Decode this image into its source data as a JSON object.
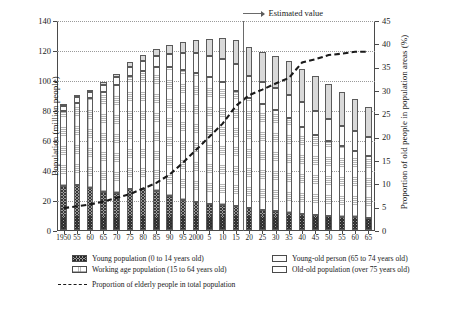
{
  "chart_data": {
    "type": "bar",
    "title": "",
    "subtitle": "",
    "xlabel": "",
    "ylabel": "Population (million people)",
    "y2label": "Proportion of old people in  population areas (%)",
    "ylim": [
      0,
      140
    ],
    "y2lim": [
      0,
      45
    ],
    "yticks": [
      0,
      20,
      40,
      60,
      80,
      100,
      120,
      140
    ],
    "y2ticks": [
      0,
      5,
      10,
      15,
      20,
      25,
      30,
      35,
      40,
      45
    ],
    "grid": true,
    "legend_position": "below-plot",
    "stacked": true,
    "categories": [
      "1950",
      "55",
      "60",
      "65",
      "70",
      "75",
      "80",
      "85",
      "90",
      "95",
      "2000",
      "5",
      "10",
      "15",
      "20",
      "25",
      "30",
      "35",
      "40",
      "45",
      "50",
      "55",
      "60",
      "65"
    ],
    "series": [
      {
        "name": "Young population (0 to 14 years old)",
        "key": "young",
        "pattern": "crosshatch-dark",
        "values": [
          29.4,
          30.0,
          28.1,
          25.2,
          24.8,
          27.2,
          27.5,
          26.0,
          22.5,
          20.0,
          18.5,
          17.6,
          16.8,
          15.9,
          14.6,
          13.2,
          12.4,
          11.6,
          10.7,
          10.0,
          9.4,
          8.9,
          8.5,
          8.0
        ]
      },
      {
        "name": "Working age population (15 to 64 years old)",
        "key": "working",
        "pattern": "fine-dot",
        "values": [
          50.0,
          55.0,
          60.0,
          67.0,
          72.0,
          75.8,
          78.8,
          82.5,
          86.0,
          87.0,
          86.2,
          84.1,
          81.7,
          77.0,
          73.4,
          70.8,
          67.7,
          63.4,
          57.9,
          53.5,
          50.1,
          47.2,
          44.2,
          41.1
        ]
      },
      {
        "name": "Young-old person (65 to 74 years old)",
        "key": "young_old",
        "pattern": "solid-light",
        "values": [
          3.1,
          3.4,
          3.8,
          4.3,
          5.1,
          5.9,
          6.6,
          7.4,
          8.9,
          11.1,
          13.0,
          14.1,
          15.2,
          17.5,
          14.9,
          14.6,
          14.3,
          15.0,
          16.8,
          15.9,
          14.3,
          13.4,
          13.1,
          12.7
        ]
      },
      {
        "name": "Old-old population (over 75 years old)",
        "key": "old_old",
        "pattern": "solid-grey",
        "values": [
          1.1,
          1.4,
          1.6,
          1.9,
          2.3,
          2.9,
          3.7,
          4.7,
          5.9,
          7.2,
          9.0,
          11.6,
          14.1,
          16.4,
          18.8,
          20.2,
          21.9,
          22.5,
          22.2,
          23.0,
          23.5,
          22.4,
          21.4,
          20.2
        ]
      }
    ],
    "line_series": {
      "name": "Proportion of elderly people in total population",
      "style": "dashed",
      "axis": "right",
      "color": "#1a1a1a",
      "x": [
        "1950",
        "55",
        "60",
        "65",
        "70",
        "75",
        "80",
        "85",
        "90",
        "95",
        "2000",
        "5",
        "10",
        "15",
        "20",
        "25",
        "30",
        "35",
        "40",
        "45",
        "50",
        "55",
        "60",
        "65"
      ],
      "values": [
        4.9,
        5.3,
        5.7,
        6.3,
        7.1,
        7.9,
        9.1,
        10.3,
        12.1,
        14.6,
        17.4,
        20.2,
        23.0,
        26.8,
        29.1,
        30.3,
        31.6,
        32.8,
        36.1,
        36.8,
        37.7,
        38.0,
        38.4,
        38.4
      ]
    },
    "annotation": {
      "text": "Estimated value",
      "at_category": "15",
      "direction": "right"
    }
  },
  "axes": {
    "left": {
      "title": "Population (million people)",
      "ticks": [
        "140",
        "120",
        "100",
        "80",
        "60",
        "40",
        "20",
        "0"
      ]
    },
    "right": {
      "title": "Proportion of old people in  population areas (%)",
      "ticks": [
        "45",
        "40",
        "35",
        "30",
        "25",
        "20",
        "15",
        "10",
        "5",
        "0"
      ]
    },
    "bottom": {
      "ticks": [
        "1950",
        "55",
        "60",
        "65",
        "70",
        "75",
        "80",
        "85",
        "90",
        "95",
        "2000",
        "5",
        "10",
        "15",
        "20",
        "25",
        "30",
        "35",
        "40",
        "45",
        "50",
        "55",
        "60",
        "65"
      ]
    }
  },
  "annotation": {
    "label": "Estimated value"
  },
  "legend": {
    "items": [
      {
        "label": "Young population (0 to 14 years old)",
        "swatch": "swatch-crosshatch"
      },
      {
        "label": "Working age population (15 to 64 years old)",
        "swatch": "swatch-dotted"
      },
      {
        "label": "Young-old person (65 to 74 years old)",
        "swatch": "swatch-light"
      },
      {
        "label": "Old-old population (over 75 years old)",
        "swatch": "swatch-outline"
      },
      {
        "label": "Proportion of elderly people in total population",
        "swatch": "dashed-line"
      }
    ]
  }
}
